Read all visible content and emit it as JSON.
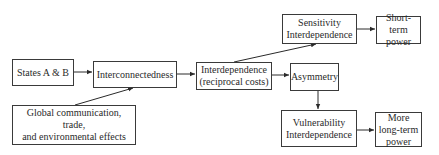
{
  "diagram": {
    "nodes": {
      "states": {
        "label": "States A & B"
      },
      "interconnectedness": {
        "label": "Interconnectedness"
      },
      "global": {
        "label_line1": "Global communication, trade,",
        "label_line2": "and environmental effects"
      },
      "interdependence": {
        "label_line1": "Interdependence",
        "label_line2": "(reciprocal costs)"
      },
      "asymmetry": {
        "label": "Asymmetry"
      },
      "sensitivity": {
        "label_line1": "Sensitivity",
        "label_line2": "Interdependence"
      },
      "short_term": {
        "label_line1": "Short-term",
        "label_line2": "power"
      },
      "vulnerability": {
        "label_line1": "Vulnerability",
        "label_line2": "Interdependence"
      },
      "long_term": {
        "label_line1": "More",
        "label_line2": "long-term",
        "label_line3": "power"
      }
    },
    "edges": [
      {
        "from": "states",
        "to": "interconnectedness"
      },
      {
        "from": "global",
        "to": "interconnectedness"
      },
      {
        "from": "interconnectedness",
        "to": "interdependence"
      },
      {
        "from": "interdependence",
        "to": "sensitivity"
      },
      {
        "from": "interdependence",
        "to": "asymmetry"
      },
      {
        "from": "sensitivity",
        "to": "short_term"
      },
      {
        "from": "asymmetry",
        "to": "vulnerability"
      },
      {
        "from": "vulnerability",
        "to": "long_term"
      }
    ],
    "colors": {
      "stroke": "#3a3a3a",
      "background": "#ffffff"
    }
  }
}
